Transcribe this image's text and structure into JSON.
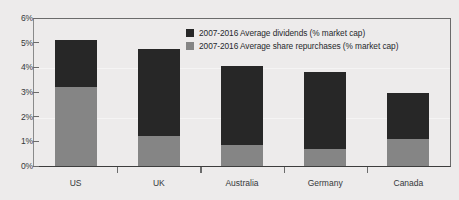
{
  "chart_data": {
    "type": "bar",
    "subtype": "stacked-bar",
    "title": "",
    "xlabel": "",
    "ylabel": "",
    "ylim": [
      0,
      6
    ],
    "y_tick_labels": [
      "6%",
      "5%",
      "4%",
      "3%",
      "2%",
      "1%",
      "0%"
    ],
    "y_tick_values": [
      6,
      5,
      4,
      3,
      2,
      1,
      0
    ],
    "y_unit": "%",
    "grid": false,
    "legend_position": "inside-top-right",
    "categories": [
      "US",
      "UK",
      "Australia",
      "Germany",
      "Canada"
    ],
    "series": [
      {
        "name": "2007-2016 Average share repurchases (% market cap)",
        "color": "#858585",
        "values": [
          3.2,
          1.2,
          0.85,
          0.7,
          1.1
        ]
      },
      {
        "name": "2007-2016 Average dividends (% market cap)",
        "color": "#272727",
        "values": [
          1.9,
          3.55,
          3.2,
          3.1,
          1.85
        ]
      }
    ],
    "totals": [
      5.1,
      4.75,
      4.05,
      3.8,
      2.95
    ],
    "stack_order_bottom_to_top": [
      "2007-2016 Average share repurchases (% market cap)",
      "2007-2016 Average dividends (% market cap)"
    ]
  },
  "legend": {
    "items": [
      {
        "label": "2007-2016 Average dividends (% market cap)",
        "swatch": "dark-square-swatch"
      },
      {
        "label": "2007-2016 Average share repurchases (% market cap)",
        "swatch": "gray-square-swatch"
      }
    ]
  },
  "colors": {
    "background": "#edebeb",
    "dividends": "#272727",
    "repurchases": "#858585",
    "axis": "#6b6b6b",
    "text": "#35383a"
  }
}
